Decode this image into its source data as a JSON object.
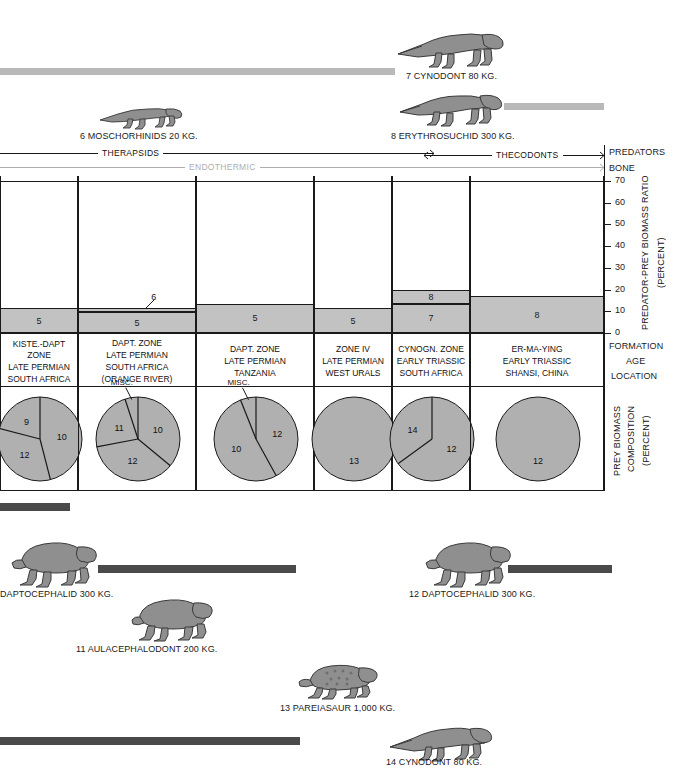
{
  "figure": {
    "right_axis": {
      "predators_label": "PREDATORS",
      "bone_label": "BONE",
      "ratio_title": "PREDATOR-PREY BIOMASS RATIO",
      "ratio_units": "(PERCENT)",
      "formation_label": "FORMATION",
      "age_label": "AGE",
      "location_label": "LOCATION",
      "prey_title": "PREY BIOMASS",
      "prey_title2": "COMPOSITION",
      "prey_units": "(PERCENT)"
    },
    "brackets": [
      {
        "label": "THERAPSIDS",
        "style": "dark"
      },
      {
        "label": "THECODONTS",
        "style": "dark"
      },
      {
        "label": "ENDOTHERMIC",
        "style": "light"
      }
    ]
  },
  "chart_data": {
    "type": "bar",
    "ylabel": "PREDATOR-PREY BIOMASS RATIO (PERCENT)",
    "ylim": [
      0,
      70
    ],
    "yticks": [
      0,
      10,
      20,
      30,
      40,
      50,
      60,
      70
    ],
    "grid": false,
    "categories": [
      "KISTE.-DAPT ZONE",
      "DAPT. ZONE",
      "DAPT. ZONE",
      "ZONE IV",
      "CYNOGN. ZONE",
      "ER-MA-YING"
    ],
    "columns": [
      {
        "formation": "KISTE.-DAPT ZONE",
        "age": "LATE PERMIAN",
        "location": "SOUTH AFRICA",
        "location2": "",
        "segments": [
          {
            "label": "5",
            "from": 0,
            "to": 11.5
          }
        ],
        "total": 11.5
      },
      {
        "formation": "DAPT. ZONE",
        "age": "LATE PERMIAN",
        "location": "SOUTH AFRICA",
        "location2": "(ORANGE RIVER)",
        "segments": [
          {
            "label": "5",
            "from": 0,
            "to": 9.5
          },
          {
            "label": "6",
            "from": 9.5,
            "to": 11.5,
            "callout": true
          }
        ],
        "total": 11.5
      },
      {
        "formation": "DAPT. ZONE",
        "age": "LATE PERMIAN",
        "location": "TANZANIA",
        "location2": "",
        "segments": [
          {
            "label": "5",
            "from": 0,
            "to": 13.5
          }
        ],
        "total": 13.5
      },
      {
        "formation": "ZONE IV",
        "age": "LATE PERMIAN",
        "location": "WEST URALS",
        "location2": "",
        "segments": [
          {
            "label": "5",
            "from": 0,
            "to": 11.5
          }
        ],
        "total": 11.5
      },
      {
        "formation": "CYNOGN. ZONE",
        "age": "EARLY TRIASSIC",
        "location": "SOUTH AFRICA",
        "location2": "",
        "segments": [
          {
            "label": "7",
            "from": 0,
            "to": 13.5
          },
          {
            "label": "8",
            "from": 13.5,
            "to": 20.0
          }
        ],
        "total": 20.0
      },
      {
        "formation": "ER-MA-YING",
        "age": "EARLY TRIASSIC",
        "location": "SHANSI, CHINA",
        "location2": "",
        "segments": [
          {
            "label": "8",
            "from": 0,
            "to": 17.0
          }
        ],
        "total": 17.0
      }
    ],
    "pies": [
      {
        "title": "PREY BIOMASS COMPOSITION (PERCENT)",
        "misc": "",
        "slices": [
          {
            "label": "10",
            "value": 46
          },
          {
            "label": "12",
            "value": 33
          },
          {
            "label": "9",
            "value": 21
          }
        ]
      },
      {
        "title": "PREY BIOMASS COMPOSITION (PERCENT)",
        "misc": "MISC.",
        "slices": [
          {
            "label": "10",
            "value": 36
          },
          {
            "label": "12",
            "value": 36
          },
          {
            "label": "11",
            "value": 23
          },
          {
            "label": "MISC.",
            "value": 5
          }
        ]
      },
      {
        "title": "PREY BIOMASS COMPOSITION (PERCENT)",
        "misc": "MISC.",
        "slices": [
          {
            "label": "12",
            "value": 42
          },
          {
            "label": "10",
            "value": 52
          },
          {
            "label": "MISC.",
            "value": 6
          }
        ]
      },
      {
        "title": "PREY BIOMASS COMPOSITION (PERCENT)",
        "misc": "",
        "slices": [
          {
            "label": "13",
            "value": 100
          }
        ]
      },
      {
        "title": "PREY BIOMASS COMPOSITION (PERCENT)",
        "misc": "",
        "slices": [
          {
            "label": "12",
            "value": 65
          },
          {
            "label": "14",
            "value": 35
          }
        ]
      },
      {
        "title": "PREY BIOMASS COMPOSITION (PERCENT)",
        "misc": "",
        "slices": [
          {
            "label": "12",
            "value": 100
          }
        ]
      }
    ]
  },
  "animals": {
    "top": [
      {
        "id": "7",
        "name": "7 CYNODONT 80 KG."
      },
      {
        "id": "6",
        "name": "6 MOSCHORHINIDS 20 KG."
      },
      {
        "id": "8",
        "name": "8 ERYTHROSUCHID 300 KG."
      }
    ],
    "bottom": [
      {
        "id": "10",
        "name": "DAPTOCEPHALID 300 KG."
      },
      {
        "id": "11",
        "name": "11 AULACEPHALODONT 200 KG."
      },
      {
        "id": "12",
        "name": "12 DAPTOCEPHALID 300 KG."
      },
      {
        "id": "13",
        "name": "13 PAREIASAUR 1,000 KG."
      },
      {
        "id": "14",
        "name": "14 CYNODONT 80 KG."
      }
    ]
  },
  "colors": {
    "bar_fill": "#c2c2c2",
    "pie_fill": "#b0b0b0",
    "rule": "#1a1a1a",
    "light_rule": "#aeaeae",
    "scalebar_light": "#b9b9b9",
    "scalebar_dark": "#4a4a4a"
  }
}
